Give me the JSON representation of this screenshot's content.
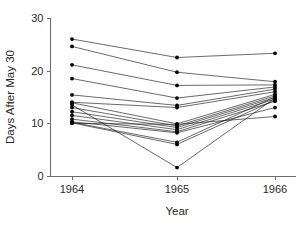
{
  "chart_data": {
    "type": "line",
    "title": "",
    "subtitle": "",
    "xlabel": "Year",
    "ylabel": "Days After May 30",
    "categories": [
      "1964",
      "1965",
      "1966"
    ],
    "x": [
      1964,
      1965,
      1966
    ],
    "xlim": [
      1963.6,
      1966.4
    ],
    "ylim": [
      0,
      30
    ],
    "ytick_labels": [
      "0",
      "10",
      "20",
      "30"
    ],
    "ytick_values": [
      0,
      10,
      20,
      30
    ],
    "xtick_labels": [
      "1964",
      "1965",
      "1966"
    ],
    "grid": false,
    "legend": false,
    "legend_position": "none",
    "marker": "filled-circle",
    "annotations": [],
    "series": [
      {
        "name": "subject-1",
        "values": [
          26.0,
          22.5,
          23.3
        ]
      },
      {
        "name": "subject-2",
        "values": [
          24.6,
          19.7,
          17.9
        ]
      },
      {
        "name": "subject-3",
        "values": [
          21.1,
          17.2,
          17.3
        ]
      },
      {
        "name": "subject-4",
        "values": [
          18.5,
          14.8,
          16.9
        ]
      },
      {
        "name": "subject-5",
        "values": [
          15.4,
          13.4,
          16.5
        ]
      },
      {
        "name": "subject-6",
        "values": [
          14.0,
          13.0,
          16.0
        ]
      },
      {
        "name": "subject-7",
        "values": [
          13.9,
          9.9,
          15.5
        ]
      },
      {
        "name": "subject-8",
        "values": [
          13.0,
          9.5,
          15.2
        ]
      },
      {
        "name": "subject-9",
        "values": [
          12.2,
          9.2,
          14.9
        ]
      },
      {
        "name": "subject-10",
        "values": [
          11.5,
          8.8,
          14.6
        ]
      },
      {
        "name": "subject-11",
        "values": [
          10.8,
          8.4,
          14.2
        ]
      },
      {
        "name": "subject-12",
        "values": [
          10.3,
          8.2,
          13.0
        ]
      },
      {
        "name": "subject-13",
        "values": [
          10.2,
          6.4,
          15.0
        ]
      },
      {
        "name": "subject-14",
        "values": [
          10.1,
          6.0,
          14.4
        ]
      },
      {
        "name": "subject-15",
        "values": [
          10.0,
          9.8,
          11.3
        ]
      },
      {
        "name": "subject-16",
        "values": [
          13.5,
          1.6,
          14.8
        ]
      }
    ]
  },
  "axes": {
    "y_title": "Days After May 30",
    "x_title": "Year"
  }
}
